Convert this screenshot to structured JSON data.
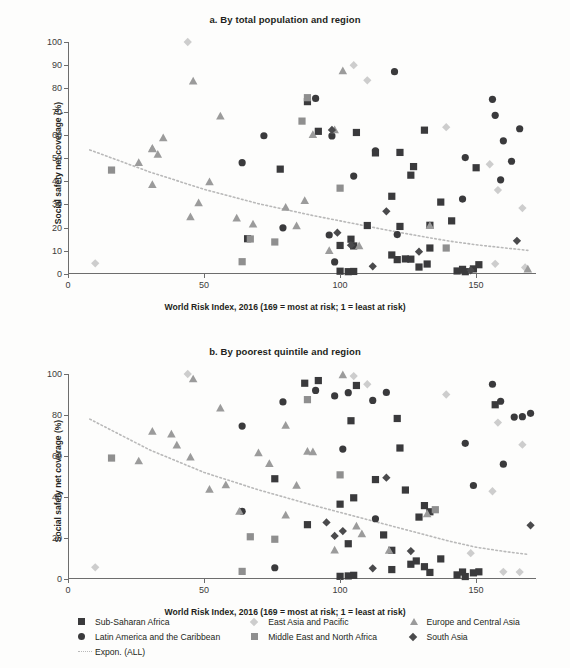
{
  "colors": {
    "sub_saharan_africa": "#3a3a3c",
    "latin_america_caribbean": "#3a3a3c",
    "east_asia_pacific": "#cdcdcd",
    "middle_east_north_africa": "#8f8f8f",
    "europe_central_asia": "#9b9b9b",
    "south_asia": "#4a4a4c",
    "trendline": "#b9b9b9",
    "axis": "#6d6d6d",
    "text": "#231f20",
    "background": "#fdfdfc"
  },
  "legend": {
    "items": [
      {
        "label": "Sub-Saharan Africa",
        "marker": "square",
        "color_key": "sub_saharan_africa"
      },
      {
        "label": "East Asia and Pacific",
        "marker": "diamond",
        "color_key": "east_asia_pacific"
      },
      {
        "label": "Europe and Central Asia",
        "marker": "triangle",
        "color_key": "europe_central_asia"
      },
      {
        "label": "Latin America and the Caribbean",
        "marker": "circle",
        "color_key": "latin_america_caribbean"
      },
      {
        "label": "Middle East and North Africa",
        "marker": "square",
        "color_key": "middle_east_north_africa"
      },
      {
        "label": "South Asia",
        "marker": "diamond",
        "color_key": "south_asia"
      },
      {
        "label": "Expon. (ALL)",
        "marker": "dotted-line",
        "color_key": "trendline"
      }
    ]
  },
  "chart_data": [
    {
      "id": "panel-a",
      "type": "scatter",
      "title": "a. By total population and region",
      "xlabel": "World Risk Index, 2016 (169 = most at risk; 1 = least at risk)",
      "ylabel": "Social safety net coverage (%)",
      "xlim": [
        0,
        172
      ],
      "ylim": [
        0,
        100
      ],
      "xticks": [
        0,
        50,
        100,
        150
      ],
      "yticks": [
        0,
        10,
        20,
        30,
        40,
        50,
        60,
        70,
        80,
        90,
        100
      ],
      "grid": false,
      "legend_position": "bottom",
      "series": [
        {
          "name": "Sub-Saharan Africa",
          "marker": "square",
          "color_key": "sub_saharan_africa",
          "points": [
            [
              88,
              74.3
            ],
            [
              92,
              61.5
            ],
            [
              106,
              61.0
            ],
            [
              78,
              45.2
            ],
            [
              113,
              52.2
            ],
            [
              122,
              52.4
            ],
            [
              131,
              62.0
            ],
            [
              127,
              46.3
            ],
            [
              126,
              42.6
            ],
            [
              119,
              33.5
            ],
            [
              122,
              20.5
            ],
            [
              137,
              31.0
            ],
            [
              141,
              22.9
            ],
            [
              150,
              45.8
            ],
            [
              110,
              20.9
            ],
            [
              133,
              21.0
            ],
            [
              104,
              15.0
            ],
            [
              100,
              12.3
            ],
            [
              105,
              12.1
            ],
            [
              119,
              8.2
            ],
            [
              121,
              6.2
            ],
            [
              124,
              6.5
            ],
            [
              126,
              6.4
            ],
            [
              129,
              3.0
            ],
            [
              132,
              4.3
            ],
            [
              143,
              1.3
            ],
            [
              145,
              2.0
            ],
            [
              146,
              1.0
            ],
            [
              149,
              2.2
            ],
            [
              151,
              4.0
            ],
            [
              100,
              1.2
            ],
            [
              103,
              1.0
            ],
            [
              105,
              1.1
            ],
            [
              66,
              15.2
            ],
            [
              133,
              11.2
            ]
          ]
        },
        {
          "name": "Latin America and the Caribbean",
          "marker": "circle",
          "color_key": "latin_america_caribbean",
          "points": [
            [
              120,
              87.2
            ],
            [
              156,
              75.3
            ],
            [
              157,
              68.4
            ],
            [
              166,
              62.6
            ],
            [
              91,
              75.7
            ],
            [
              72,
              59.6
            ],
            [
              97,
              59.5
            ],
            [
              113,
              53.1
            ],
            [
              146,
              50.2
            ],
            [
              160,
              57.4
            ],
            [
              163,
              48.6
            ],
            [
              159,
              40.6
            ],
            [
              145,
              32.3
            ],
            [
              105,
              42.2
            ],
            [
              64,
              48.0
            ],
            [
              79,
              19.9
            ],
            [
              121,
              17.0
            ],
            [
              96,
              16.8
            ],
            [
              98,
              5.2
            ]
          ]
        },
        {
          "name": "East Asia and Pacific",
          "marker": "diamond",
          "color_key": "east_asia_pacific",
          "points": [
            [
              44,
              100.0
            ],
            [
              105,
              90.0
            ],
            [
              110,
              83.5
            ],
            [
              139,
              63.3
            ],
            [
              155,
              47.3
            ],
            [
              158,
              36.2
            ],
            [
              167,
              28.4
            ],
            [
              10,
              4.6
            ],
            [
              157,
              4.4
            ],
            [
              168,
              2.8
            ]
          ]
        },
        {
          "name": "Middle East and North Africa",
          "marker": "square",
          "color_key": "middle_east_north_africa",
          "points": [
            [
              88,
              76.0
            ],
            [
              86,
              65.9
            ],
            [
              100,
              37.0
            ],
            [
              67,
              15.1
            ],
            [
              76,
              13.8
            ],
            [
              64,
              5.3
            ],
            [
              16,
              44.8
            ],
            [
              139,
              11.2
            ]
          ]
        },
        {
          "name": "Europe and Central Asia",
          "marker": "triangle",
          "color_key": "europe_central_asia",
          "points": [
            [
              101,
              87.5
            ],
            [
              46,
              83.1
            ],
            [
              56,
              68.0
            ],
            [
              90,
              60.0
            ],
            [
              98,
              62.1
            ],
            [
              35,
              58.6
            ],
            [
              31,
              54.1
            ],
            [
              33,
              51.5
            ],
            [
              31,
              53.9
            ],
            [
              26,
              48.0
            ],
            [
              31,
              38.5
            ],
            [
              52,
              39.7
            ],
            [
              87,
              31.6
            ],
            [
              48,
              30.6
            ],
            [
              80,
              28.7
            ],
            [
              45,
              24.6
            ],
            [
              62,
              24.0
            ],
            [
              68,
              21.4
            ],
            [
              84,
              20.7
            ],
            [
              133,
              20.8
            ],
            [
              96,
              10.0
            ],
            [
              107,
              12.1
            ],
            [
              169,
              2.0
            ]
          ]
        },
        {
          "name": "South Asia",
          "marker": "diamond",
          "color_key": "south_asia",
          "points": [
            [
              97,
              62.1
            ],
            [
              117,
              27.0
            ],
            [
              99,
              17.8
            ],
            [
              104,
              12.4
            ],
            [
              129,
              9.6
            ],
            [
              112,
              3.3
            ],
            [
              165,
              14.3
            ],
            [
              148,
              1.6
            ]
          ]
        }
      ],
      "trendline": {
        "name": "Expon. (ALL)",
        "style": "dotted",
        "color_key": "trendline",
        "points": [
          [
            8,
            53.5
          ],
          [
            30,
            44.0
          ],
          [
            50,
            36.5
          ],
          [
            70,
            30.3
          ],
          [
            90,
            25.2
          ],
          [
            100,
            22.9
          ],
          [
            110,
            20.6
          ],
          [
            120,
            18.3
          ],
          [
            130,
            16.2
          ],
          [
            140,
            14.2
          ],
          [
            150,
            12.6
          ],
          [
            160,
            11.3
          ],
          [
            169,
            10.2
          ]
        ]
      }
    },
    {
      "id": "panel-b",
      "type": "scatter",
      "title": "b. By poorest quintile and region",
      "xlabel": "World Risk Index, 2016 (169 = most at risk; 1 = least at risk)",
      "ylabel": "Social safety net coverage (%)",
      "xlim": [
        0,
        172
      ],
      "ylim": [
        0,
        100
      ],
      "xticks": [
        0,
        50,
        100,
        150
      ],
      "yticks": [
        0,
        20,
        40,
        60,
        80,
        100
      ],
      "grid": false,
      "legend_position": "bottom",
      "series": [
        {
          "name": "Sub-Saharan Africa",
          "marker": "square",
          "color_key": "sub_saharan_africa",
          "points": [
            [
              87,
              95.5
            ],
            [
              92,
              96.8
            ],
            [
              106,
              94.4
            ],
            [
              104,
              77.2
            ],
            [
              122,
              63.9
            ],
            [
              121,
              78.3
            ],
            [
              157,
              85.0
            ],
            [
              113,
              48.5
            ],
            [
              124,
              43.4
            ],
            [
              100,
              36.5
            ],
            [
              105,
              39.6
            ],
            [
              131,
              35.8
            ],
            [
              133,
              32.8
            ],
            [
              129,
              30.2
            ],
            [
              88,
              26.5
            ],
            [
              103,
              17.2
            ],
            [
              116,
              21.5
            ],
            [
              119,
              14.0
            ],
            [
              126,
              7.2
            ],
            [
              128,
              8.8
            ],
            [
              131,
              6.0
            ],
            [
              133,
              3.2
            ],
            [
              137,
              9.8
            ],
            [
              119,
              4.6
            ],
            [
              100,
              1.3
            ],
            [
              103,
              1.5
            ],
            [
              105,
              1.8
            ],
            [
              143,
              2.0
            ],
            [
              145,
              3.4
            ],
            [
              146,
              1.2
            ],
            [
              149,
              3.0
            ],
            [
              151,
              3.5
            ],
            [
              76,
              48.9
            ]
          ]
        },
        {
          "name": "Latin America and the Caribbean",
          "marker": "circle",
          "color_key": "latin_america_caribbean",
          "points": [
            [
              156,
              95.0
            ],
            [
              159,
              86.7
            ],
            [
              164,
              79.0
            ],
            [
              167,
              79.2
            ],
            [
              170,
              80.8
            ],
            [
              91,
              92.0
            ],
            [
              117,
              91.0
            ],
            [
              103,
              90.9
            ],
            [
              98,
              89.3
            ],
            [
              112,
              87.1
            ],
            [
              79,
              86.4
            ],
            [
              64,
              74.6
            ],
            [
              146,
              66.2
            ],
            [
              101,
              63.4
            ],
            [
              160,
              56.0
            ],
            [
              149,
              45.6
            ],
            [
              64,
              33.0
            ],
            [
              113,
              29.4
            ],
            [
              76,
              5.5
            ]
          ]
        },
        {
          "name": "East Asia and Pacific",
          "marker": "diamond",
          "color_key": "east_asia_pacific",
          "points": [
            [
              44,
              100.0
            ],
            [
              105,
              99.0
            ],
            [
              110,
              95.0
            ],
            [
              139,
              90.0
            ],
            [
              158,
              76.3
            ],
            [
              167,
              65.5
            ],
            [
              156,
              42.8
            ],
            [
              148,
              12.6
            ],
            [
              10,
              5.7
            ],
            [
              160,
              3.5
            ],
            [
              166,
              3.4
            ]
          ]
        },
        {
          "name": "Middle East and North Africa",
          "marker": "square",
          "color_key": "middle_east_north_africa",
          "points": [
            [
              88,
              87.5
            ],
            [
              100,
              50.8
            ],
            [
              67,
              20.6
            ],
            [
              76,
              19.4
            ],
            [
              64,
              3.7
            ],
            [
              16,
              59.0
            ],
            [
              135,
              33.8
            ]
          ]
        },
        {
          "name": "Europe and Central Asia",
          "marker": "triangle",
          "color_key": "europe_central_asia",
          "points": [
            [
              101,
              99.5
            ],
            [
              46,
              97.5
            ],
            [
              56,
              83.3
            ],
            [
              31,
              72.0
            ],
            [
              38,
              70.6
            ],
            [
              26,
              57.5
            ],
            [
              40,
              65.3
            ],
            [
              45,
              59.4
            ],
            [
              70,
              61.5
            ],
            [
              90,
              61.9
            ],
            [
              80,
              74.9
            ],
            [
              88,
              62.2
            ],
            [
              74,
              56.2
            ],
            [
              52,
              43.6
            ],
            [
              58,
              45.8
            ],
            [
              84,
              45.6
            ],
            [
              63,
              32.9
            ],
            [
              80,
              31.1
            ],
            [
              106,
              25.7
            ],
            [
              98,
              14.0
            ],
            [
              118,
              13.9
            ],
            [
              132,
              31.7
            ],
            [
              108,
              22.0
            ]
          ]
        },
        {
          "name": "South Asia",
          "marker": "diamond",
          "color_key": "south_asia",
          "points": [
            [
              117,
              49.4
            ],
            [
              95,
              27.6
            ],
            [
              101,
              23.4
            ],
            [
              126,
              13.6
            ],
            [
              112,
              5.2
            ],
            [
              170,
              26.2
            ],
            [
              98,
              21.0
            ]
          ]
        }
      ],
      "trendline": {
        "name": "Expon. (ALL)",
        "style": "dotted",
        "color_key": "trendline",
        "points": [
          [
            8,
            78.0
          ],
          [
            30,
            63.0
          ],
          [
            50,
            52.0
          ],
          [
            70,
            43.5
          ],
          [
            90,
            36.0
          ],
          [
            100,
            32.5
          ],
          [
            110,
            29.0
          ],
          [
            120,
            25.5
          ],
          [
            130,
            22.0
          ],
          [
            140,
            18.5
          ],
          [
            150,
            15.5
          ],
          [
            160,
            13.5
          ],
          [
            169,
            12.0
          ]
        ]
      }
    }
  ]
}
